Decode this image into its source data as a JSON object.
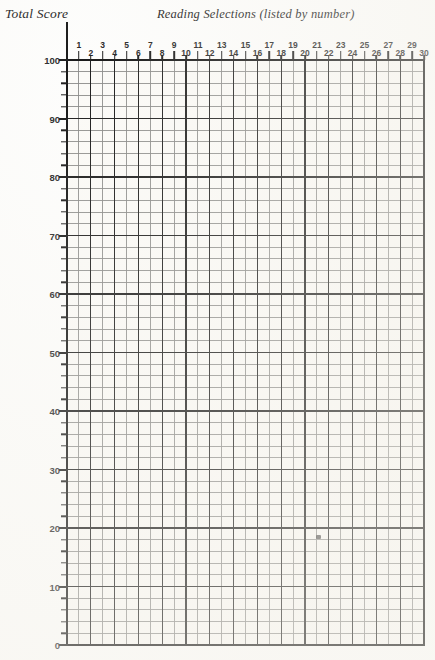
{
  "page": {
    "width": 435,
    "height": 660,
    "background_color": "#fdfdfc",
    "ink_color": "#171717"
  },
  "header": {
    "y_axis_title": "Total Score",
    "x_axis_title": "Reading Selections (listed by number)"
  },
  "chart_data": {
    "type": "line",
    "title": "",
    "subtitle": "",
    "xlabel": "Reading Selections (listed by number)",
    "ylabel": "Total Score",
    "xlim": [
      0,
      30
    ],
    "ylim": [
      0,
      100
    ],
    "grid": true,
    "grid_minor_x_step": 1,
    "grid_minor_y_step": 2,
    "grid_major_x_step": 2,
    "grid_major_y_step": 10,
    "legend": "none",
    "x_tick_labels": [
      "1",
      "2",
      "3",
      "4",
      "5",
      "6",
      "7",
      "8",
      "9",
      "10",
      "11",
      "12",
      "13",
      "14",
      "15",
      "16",
      "17",
      "18",
      "19",
      "20",
      "21",
      "22",
      "23",
      "24",
      "25",
      "26",
      "27",
      "28",
      "29",
      "30"
    ],
    "x_tick_values": [
      1,
      2,
      3,
      4,
      5,
      6,
      7,
      8,
      9,
      10,
      11,
      12,
      13,
      14,
      15,
      16,
      17,
      18,
      19,
      20,
      21,
      22,
      23,
      24,
      25,
      26,
      27,
      28,
      29,
      30
    ],
    "y_tick_labels": [
      "0",
      "10",
      "20",
      "30",
      "40",
      "50",
      "60",
      "70",
      "80",
      "90",
      "100"
    ],
    "y_tick_values": [
      0,
      10,
      20,
      30,
      40,
      50,
      60,
      70,
      80,
      90,
      100
    ],
    "y_minor_tick_values": [
      2,
      4,
      6,
      8,
      12,
      14,
      16,
      18,
      22,
      24,
      26,
      28,
      32,
      34,
      36,
      38,
      42,
      44,
      46,
      48,
      52,
      54,
      56,
      58,
      62,
      64,
      66,
      68,
      72,
      74,
      76,
      78,
      82,
      84,
      86,
      88,
      92,
      94,
      96,
      98
    ],
    "series": [],
    "values": [],
    "categories": [],
    "annotations": [
      {
        "name": "ink-smudge",
        "x": 21.1,
        "y": 18.5,
        "note": ""
      }
    ]
  }
}
